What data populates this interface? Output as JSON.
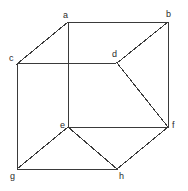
{
  "figure": {
    "type": "line-diagram",
    "width": 188,
    "height": 191,
    "background_color": "#ffffff",
    "line_color": "#3a3a3a",
    "label_color": "#2b2b2b",
    "line_width": 1,
    "label_font_size": 9
  },
  "vertices": [
    {
      "id": "a",
      "label": "a",
      "x": 68,
      "y": 22,
      "label_x": 63,
      "label_y": 11
    },
    {
      "id": "b",
      "label": "b",
      "x": 168,
      "y": 22,
      "label_x": 166,
      "label_y": 10
    },
    {
      "id": "c",
      "label": "c",
      "x": 17,
      "y": 64,
      "label_x": 9,
      "label_y": 54
    },
    {
      "id": "d",
      "label": "d",
      "x": 117,
      "y": 63,
      "label_x": 112,
      "label_y": 50
    },
    {
      "id": "e",
      "label": "e",
      "x": 68,
      "y": 127,
      "label_x": 60,
      "label_y": 121
    },
    {
      "id": "f",
      "label": "f",
      "x": 168,
      "y": 127,
      "label_x": 172,
      "label_y": 121
    },
    {
      "id": "g",
      "label": "g",
      "x": 17,
      "y": 169,
      "label_x": 10,
      "label_y": 172
    },
    {
      "id": "h",
      "label": "h",
      "x": 117,
      "y": 169,
      "label_x": 119,
      "label_y": 172
    }
  ],
  "edges": [
    {
      "id": "a-b",
      "from": "a",
      "to": "b",
      "kind": "top-back"
    },
    {
      "id": "a-c",
      "from": "a",
      "to": "c",
      "kind": "top-receding"
    },
    {
      "id": "a-e",
      "from": "a",
      "to": "e",
      "kind": "vertical"
    },
    {
      "id": "b-d",
      "from": "b",
      "to": "d",
      "kind": "top-receding"
    },
    {
      "id": "b-f",
      "from": "b",
      "to": "f",
      "kind": "vertical"
    },
    {
      "id": "c-d",
      "from": "c",
      "to": "d",
      "kind": "front-top"
    },
    {
      "id": "c-g",
      "from": "c",
      "to": "g",
      "kind": "vertical"
    },
    {
      "id": "d-f",
      "from": "d",
      "to": "f",
      "kind": "vertical"
    },
    {
      "id": "e-f",
      "from": "e",
      "to": "f",
      "kind": "horizontal"
    },
    {
      "id": "e-g",
      "from": "e",
      "to": "g",
      "kind": "bottom-receding"
    },
    {
      "id": "e-h",
      "from": "e",
      "to": "h",
      "kind": "vertical"
    },
    {
      "id": "g-h",
      "from": "g",
      "to": "h",
      "kind": "front-bottom"
    },
    {
      "id": "h-f",
      "from": "h",
      "to": "f",
      "kind": "bottom-receding"
    }
  ]
}
